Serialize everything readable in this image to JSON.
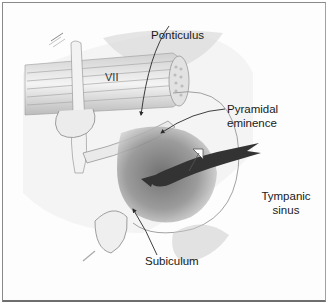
{
  "figure": {
    "labels": {
      "nerve": "VII",
      "ponticulus": "Ponticulus",
      "pyramidal_line1": "Pyramidal",
      "pyramidal_line2": "eminence",
      "tympanic_line1": "Tympanic",
      "tympanic_line2": "sinus",
      "subiculum": "Subiculum"
    },
    "colors": {
      "background": "#fdfdfd",
      "border": "#8a8a8a",
      "label_text": "#1a1a1a",
      "dark_arrow": "#3a3a3a",
      "shading": "#b8b8b8"
    }
  }
}
